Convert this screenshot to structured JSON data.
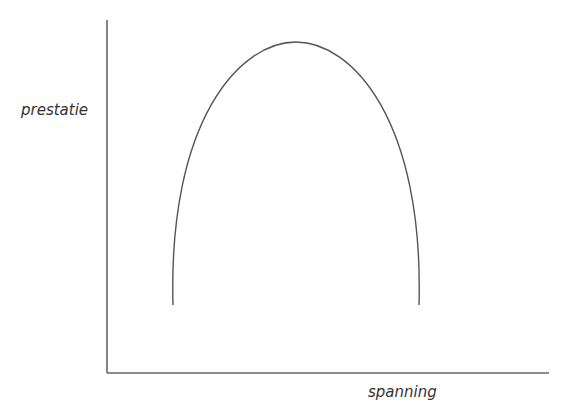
{
  "diagram": {
    "y_axis_label": "prestatie",
    "x_axis_label": "spanning",
    "curve": "inverted-U",
    "stroke_color": "#555555"
  }
}
